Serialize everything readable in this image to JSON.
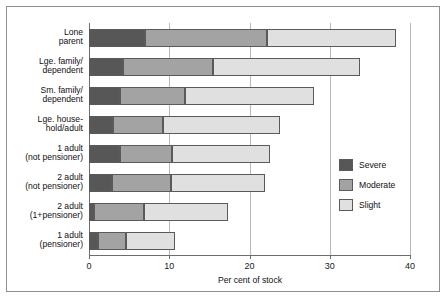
{
  "chart_data": {
    "type": "bar",
    "orientation": "horizontal",
    "stacked": true,
    "title": "",
    "xlabel": "Per cent of stock",
    "ylabel": "",
    "xlim": [
      0,
      40
    ],
    "xticks": [
      0,
      10,
      20,
      30,
      40
    ],
    "xtick_labels": [
      "0",
      "10",
      "20",
      "30",
      "40"
    ],
    "grid": "vertical",
    "legend_position": "right-middle",
    "categories": [
      "Lone\nparent",
      "Lge. family/\ndependent",
      "Sm. family/\ndependent",
      "Lge. house-\nhold/adult",
      "1 adult\n(not pensioner)",
      "2 adult\n(not pensioner)",
      "2 adult\n(1+pensioner)",
      "1 adult\n(pensioner)"
    ],
    "series": [
      {
        "name": "Severe",
        "color": "#575757",
        "values": [
          7.0,
          4.2,
          3.9,
          3.0,
          3.9,
          2.9,
          0.6,
          1.1
        ]
      },
      {
        "name": "Moderate",
        "color": "#a3a3a3",
        "values": [
          15.2,
          11.2,
          8.1,
          6.2,
          6.4,
          7.3,
          6.2,
          3.5
        ]
      },
      {
        "name": "Slight",
        "color": "#e0e0e0",
        "values": [
          16.0,
          18.4,
          16.0,
          14.6,
          12.3,
          11.7,
          10.5,
          6.1
        ]
      }
    ],
    "totals": [
      38.2,
      33.8,
      28.0,
      23.8,
      22.6,
      21.9,
      17.3,
      10.7
    ]
  },
  "legend": {
    "items": [
      {
        "label": "Severe",
        "color": "#575757"
      },
      {
        "label": "Moderate",
        "color": "#a3a3a3"
      },
      {
        "label": "Slight",
        "color": "#e0e0e0"
      }
    ]
  },
  "axis": {
    "x_title": "Per cent of stock"
  }
}
